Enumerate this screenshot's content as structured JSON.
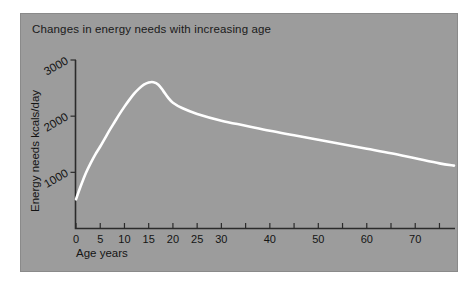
{
  "figure": {
    "background_color": "#ffffff",
    "panel_color": "#9c9c9c",
    "panel_border_color": "#8a8a8a",
    "curve_color": "#ffffff",
    "axis_color": "#2b2b2b",
    "text_color": "#141414"
  },
  "chart_data": {
    "type": "line",
    "title": "Changes in energy needs with increasing age",
    "xlabel": "Age  years",
    "ylabel": "Energy needs  kcals/day",
    "xlim": [
      0,
      78
    ],
    "ylim": [
      0,
      3000
    ],
    "grid": false,
    "legend": null,
    "xticks": [
      0,
      5,
      10,
      15,
      20,
      25,
      30,
      35,
      40,
      45,
      50,
      55,
      60,
      65,
      70,
      75
    ],
    "xtick_labels": [
      "0",
      "5",
      "10",
      "15",
      "20",
      "25",
      "30",
      "",
      "40",
      "",
      "50",
      "",
      "60",
      "",
      "70",
      ""
    ],
    "yticks": [
      1000,
      2000,
      3000
    ],
    "ytick_labels": [
      "1000",
      "2000",
      "3000"
    ],
    "ytick_label_rotation": -30,
    "series": [
      {
        "name": "Energy needs",
        "x": [
          0,
          1,
          2,
          3,
          4,
          5,
          6,
          7,
          8,
          9,
          10,
          11,
          12,
          13,
          14,
          15,
          16,
          17,
          18,
          19,
          20,
          22,
          25,
          30,
          35,
          40,
          45,
          50,
          55,
          60,
          65,
          70,
          75,
          78
        ],
        "values": [
          520,
          760,
          980,
          1160,
          1320,
          1460,
          1610,
          1760,
          1900,
          2040,
          2170,
          2290,
          2400,
          2490,
          2560,
          2600,
          2605,
          2560,
          2450,
          2330,
          2240,
          2140,
          2040,
          1920,
          1830,
          1740,
          1660,
          1580,
          1500,
          1420,
          1340,
          1250,
          1160,
          1120
        ]
      }
    ]
  },
  "labels": {
    "title": "Changes in energy needs with increasing age",
    "x_axis_title": "Age  years",
    "y_axis_title": "Energy needs  kcals/day"
  }
}
